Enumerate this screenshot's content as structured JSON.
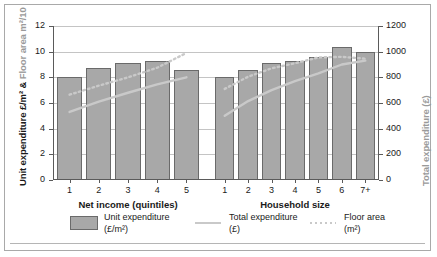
{
  "axes": {
    "left_title_main": "Unit expenditure £/m² &",
    "left_title_muted": " Floor area m²/10",
    "right_title": "Total expenditure (£)",
    "left_ticks": [
      "0",
      "2",
      "4",
      "6",
      "8",
      "10",
      "12"
    ],
    "right_ticks": [
      "0",
      "200",
      "400",
      "600",
      "800",
      "1000",
      "1200"
    ],
    "left_min": 0,
    "left_max": 12,
    "right_min": 0,
    "right_max": 1200
  },
  "groups": [
    {
      "name": "net-income",
      "title": "Net income (quintiles)",
      "categories": [
        "1",
        "2",
        "3",
        "4",
        "5"
      ]
    },
    {
      "name": "household-size",
      "title": "Household size",
      "categories": [
        "1",
        "2",
        "3",
        "4",
        "5",
        "6",
        "7+"
      ]
    }
  ],
  "legend": [
    {
      "swatch": "bar-swatch",
      "label": "Unit expenditure",
      "sub": "(£/m²)"
    },
    {
      "swatch": "solid-line-swatch",
      "label": "Total expenditure",
      "sub": "(£)"
    },
    {
      "swatch": "dotted-line-swatch",
      "label": "Floor area",
      "sub": "(m²)"
    }
  ],
  "colors": {
    "bar_fill": "#a8a8a8",
    "bar_border": "#6a6a6a",
    "line_total": "#c9c9c9",
    "line_floor": "#c9c9c9",
    "gridline": "#c4c4c4",
    "axis": "#5a5a5a",
    "frame": "#a9a9a9",
    "muted_text": "#9a9a9a"
  },
  "chart_data": {
    "type": "bar",
    "title": "",
    "xlabel": "",
    "ylabel": "Unit expenditure £/m² & Floor area m²/10",
    "y2label": "Total expenditure (£)",
    "ylim": [
      0,
      12
    ],
    "y2lim": [
      0,
      1200
    ],
    "grid": true,
    "legend_position": "bottom",
    "panels": [
      {
        "name": "Net income (quintiles)",
        "categories": [
          "1",
          "2",
          "3",
          "4",
          "5"
        ],
        "series": [
          {
            "name": "Unit expenditure (£/m²)",
            "type": "bar",
            "axis": "left",
            "values": [
              8.0,
              8.7,
              9.1,
              9.25,
              8.55
            ]
          },
          {
            "name": "Total expenditure (£)",
            "type": "line",
            "axis": "right",
            "values": [
              530,
              610,
              680,
              745,
              800
            ]
          },
          {
            "name": "Floor area (m²)",
            "type": "line-dotted",
            "axis": "left",
            "values": [
              6.65,
              7.35,
              8.0,
              8.75,
              9.9
            ]
          }
        ]
      },
      {
        "name": "Household size",
        "categories": [
          "1",
          "2",
          "3",
          "4",
          "5",
          "6",
          "7+"
        ],
        "series": [
          {
            "name": "Unit expenditure (£/m²)",
            "type": "bar",
            "axis": "left",
            "values": [
              8.0,
              8.6,
              9.1,
              9.3,
              9.55,
              10.35,
              10.0
            ]
          },
          {
            "name": "Total expenditure (£)",
            "type": "line",
            "axis": "right",
            "values": [
              500,
              615,
              700,
              770,
              830,
              900,
              930
            ]
          },
          {
            "name": "Floor area (m²)",
            "type": "line-dotted",
            "axis": "left",
            "values": [
              7.1,
              8.05,
              8.7,
              9.1,
              9.55,
              9.6,
              9.45
            ]
          }
        ]
      }
    ]
  }
}
